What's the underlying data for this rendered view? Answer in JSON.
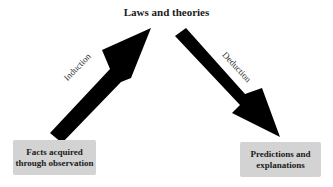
{
  "diagram": {
    "title": "Laws and theories",
    "nodes": [
      {
        "id": "facts",
        "label_line1": "Facts acquired",
        "label_line2": "through observation"
      },
      {
        "id": "predictions",
        "label_line1": "Predictions and",
        "label_line2": "explanations"
      }
    ],
    "edges": [
      {
        "from": "facts",
        "to": "laws",
        "label": "Induction"
      },
      {
        "from": "laws",
        "to": "predictions",
        "label": "Deduction"
      }
    ],
    "colors": {
      "arrow": "#000000",
      "box": "#d3d3d3",
      "text": "#1a1a1a"
    }
  }
}
